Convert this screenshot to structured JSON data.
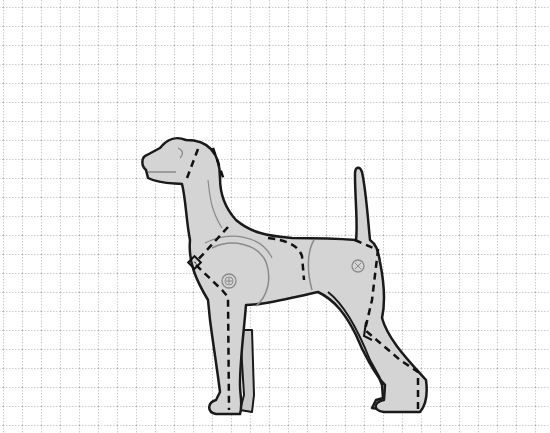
{
  "figure": {
    "title": "Dog body diagram on grid",
    "grid": {
      "spacing_px": 19,
      "offset_x": 3,
      "offset_y": 7,
      "line_color": "#9a9a9a",
      "style": "dotted"
    },
    "colors": {
      "background": "#ffffff",
      "body_fill": "#d4d4d4",
      "outline": "#1a1a1a",
      "dashed_line": "#111111",
      "contour_line": "#8a8a8a",
      "joint_marker": "#8a8a8a"
    },
    "markers": [
      {
        "name": "shoulder-joint",
        "symbol": "⊕"
      },
      {
        "name": "hip-joint",
        "symbol": "⊗"
      }
    ],
    "annotations": {
      "dashed_lines": [
        "head-to-ear",
        "neck",
        "shoulder-to-front-leg",
        "back",
        "hip-to-rear-leg",
        "rear-hock"
      ],
      "angle_markers": [
        "front-shoulder-square",
        "rear-knee-angle"
      ]
    }
  }
}
